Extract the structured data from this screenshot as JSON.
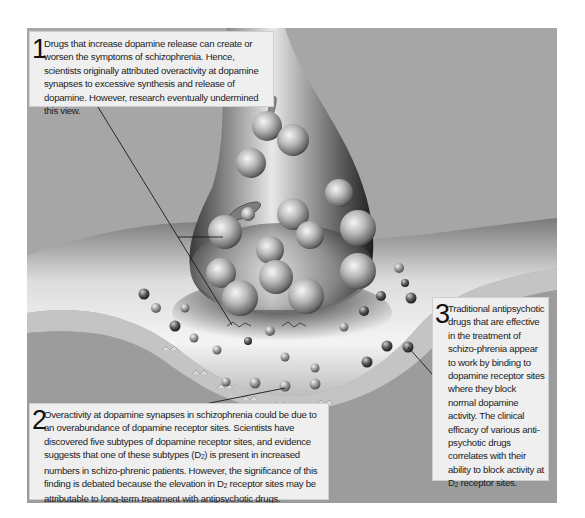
{
  "figure": {
    "colors": {
      "background": "#a3a3a3",
      "callout_bg": "#efefef",
      "text": "#1c1c1c",
      "leader_line": "#1a1a1a"
    },
    "callouts": [
      {
        "number": "1",
        "text_before_sub": "Drugs that increase dopamine release can create or worsen the symptoms of schizophrenia. Hence, scientists originally attributed overactivity at dopamine synapses to excessive synthesis and release of dopamine. However, research eventually undermined this view.",
        "sub": "",
        "text_after_sub": ""
      },
      {
        "number": "2",
        "part1": "Overactivity at dopamine synapses in schizophrenia could be due to an overabundance of dopamine receptor sites. Scientists have discovered five subtypes of dopamine receptor sites, and evidence suggests that one of these subtypes (D",
        "sub1": "2",
        "part2": ") is present in increased numbers in schizo-phrenic patients. However, the significance of this finding is debated because the elevation in D",
        "sub2": "2",
        "part3": " receptor sites may be attributable to long-term treatment with antipsychotic drugs."
      },
      {
        "number": "3",
        "part1": "Traditional antipsychotic drugs that are effective in the treatment of schizo-phrenia appear to work by binding to dopamine receptor sites where they block normal dopamine activity. The clinical efficacy of various anti-psychotic drugs correlates with their ability to block activity at D",
        "sub1": "2",
        "part2": " receptor sites."
      }
    ],
    "illustration": {
      "elements": [
        "presynaptic-terminal",
        "synaptic-vesicles",
        "dopamine-molecules",
        "postsynaptic-membrane",
        "receptor-sites",
        "leader-lines"
      ]
    }
  }
}
